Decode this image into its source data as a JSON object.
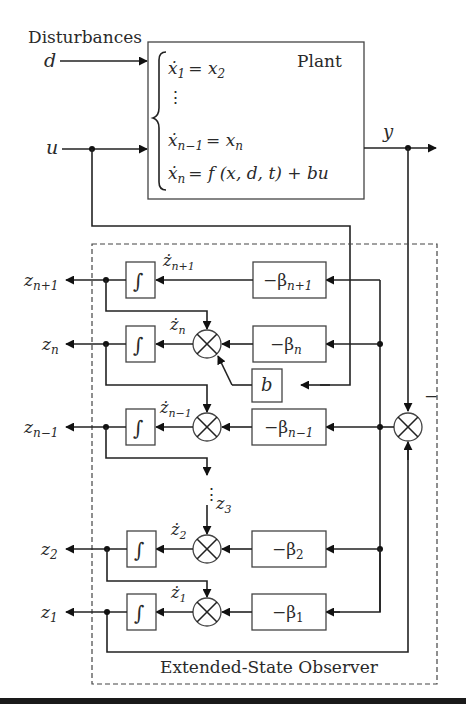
{
  "inputs": {
    "disturbances_label": "Disturbances",
    "d": "d",
    "u": "u"
  },
  "plant": {
    "label": "Plant",
    "equations": [
      {
        "lhs": "ẋ",
        "lhs_sub": "1",
        "rhs": "= x",
        "rhs_sub": "2",
        "tail": ""
      },
      {
        "lhs": "⋮",
        "lhs_sub": "",
        "rhs": "",
        "rhs_sub": "",
        "tail": ""
      },
      {
        "lhs": "ẋ",
        "lhs_sub": "n−1",
        "rhs": "= x",
        "rhs_sub": "n",
        "tail": ""
      },
      {
        "lhs": "ẋ",
        "lhs_sub": "n",
        "rhs": "= f (x, d, t) + bu",
        "rhs_sub": "",
        "tail": ""
      }
    ]
  },
  "output": {
    "y": "y"
  },
  "observer": {
    "label": "Extended-State Observer",
    "minus_sign": "−",
    "b_gain": "b",
    "rows": [
      {
        "z": "z",
        "z_sub": "n+1",
        "zdot": "ż",
        "zdot_sub": "n+1",
        "beta": "−β",
        "beta_sub": "n+1"
      },
      {
        "z": "z",
        "z_sub": "n",
        "zdot": "ż",
        "zdot_sub": "n",
        "beta": "−β",
        "beta_sub": "n"
      },
      {
        "z": "z",
        "z_sub": "n−1",
        "zdot": "ż",
        "zdot_sub": "n−1",
        "beta": "−β",
        "beta_sub": "n−1"
      },
      {
        "z": "z",
        "z_sub": "2",
        "zdot": "ż",
        "zdot_sub": "2",
        "beta": "−β",
        "beta_sub": "2"
      },
      {
        "z": "z",
        "z_sub": "1",
        "zdot": "ż",
        "zdot_sub": "1",
        "beta": "−β",
        "beta_sub": "1"
      }
    ],
    "ellipsis": "⋮",
    "z3": "z",
    "z3_sub": "3",
    "integrator_symbol": "∫"
  }
}
